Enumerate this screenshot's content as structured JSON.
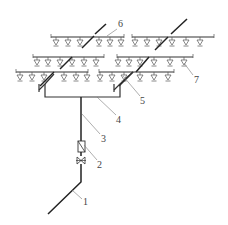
{
  "diagram": {
    "type": "sprinkler-system-schematic",
    "stroke_color": "#333333",
    "background": "#ffffff",
    "labels": [
      {
        "id": "1",
        "text": "1",
        "x": 83,
        "y": 205,
        "lx1": 72,
        "ly1": 190,
        "lx2": 82,
        "ly2": 199
      },
      {
        "id": "2",
        "text": "2",
        "x": 97,
        "y": 168,
        "lx1": 84,
        "ly1": 145,
        "lx2": 97,
        "ly2": 160
      },
      {
        "id": "3",
        "text": "3",
        "x": 101,
        "y": 142,
        "lx1": 82,
        "ly1": 114,
        "lx2": 100,
        "ly2": 134
      },
      {
        "id": "4",
        "text": "4",
        "x": 116,
        "y": 123,
        "lx1": 97,
        "ly1": 97,
        "lx2": 116,
        "ly2": 115
      },
      {
        "id": "5",
        "text": "5",
        "x": 140,
        "y": 104,
        "lx1": 123,
        "ly1": 76,
        "lx2": 140,
        "ly2": 96
      },
      {
        "id": "6",
        "text": "6",
        "x": 118,
        "y": 27,
        "lx1": 107,
        "ly1": 36,
        "lx2": 117,
        "ly2": 29
      },
      {
        "id": "7",
        "text": "7",
        "x": 194,
        "y": 83,
        "lx1": 184,
        "ly1": 63,
        "lx2": 193,
        "ly2": 75
      }
    ],
    "branches": [
      {
        "name": "upper-left",
        "x1": 51,
        "x2": 124,
        "y": 37,
        "sprinklers": [
          56,
          68,
          80,
          99,
          110,
          121
        ],
        "riser": {
          "x1": 82,
          "y1": 48,
          "x2": 94,
          "y2": 36
        }
      },
      {
        "name": "upper-right",
        "x1": 132,
        "x2": 214,
        "y": 37,
        "sprinklers": [
          135,
          147,
          159,
          172,
          186,
          200
        ],
        "riser": {
          "x1": 155,
          "y1": 50,
          "x2": 168,
          "y2": 37
        }
      },
      {
        "name": "middle-left",
        "x1": 33,
        "x2": 104,
        "y": 57,
        "sprinklers": [
          37,
          48,
          60,
          72,
          84,
          96
        ],
        "riser": {
          "x1": 60,
          "y1": 69,
          "x2": 72,
          "y2": 57
        }
      },
      {
        "name": "middle-right",
        "x1": 117,
        "x2": 193,
        "y": 57,
        "sprinklers": [
          118,
          129,
          140,
          154,
          170,
          184
        ],
        "riser": {
          "x1": 136,
          "y1": 72,
          "x2": 149,
          "y2": 57
        }
      },
      {
        "name": "lower-left",
        "x1": 16,
        "x2": 88,
        "y": 72,
        "sprinklers": [
          20,
          32,
          44,
          64,
          76,
          87
        ],
        "riser": {
          "x1": 40,
          "y1": 86,
          "x2": 54,
          "y2": 72
        }
      },
      {
        "name": "lower-right",
        "x1": 99,
        "x2": 174,
        "y": 72,
        "sprinklers": [
          100,
          112,
          124,
          140,
          154,
          168
        ],
        "riser": {
          "x1": 119,
          "y1": 86,
          "x2": 133,
          "y2": 72
        }
      }
    ],
    "upper_risers": [
      {
        "x1": 95,
        "y1": 34,
        "x2": 106,
        "y2": 24
      },
      {
        "x1": 171,
        "y1": 34,
        "x2": 187,
        "y2": 19
      }
    ]
  }
}
